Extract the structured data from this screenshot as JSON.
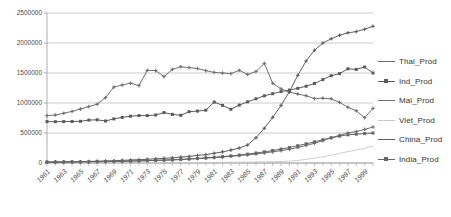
{
  "chart_data": {
    "type": "line",
    "title": "",
    "xlabel": "",
    "ylabel": "",
    "ylim": [
      0,
      2500000
    ],
    "ytick_labels": [
      "0",
      "500000",
      "1000000",
      "1500000",
      "2000000",
      "2500000"
    ],
    "yticks": [
      0,
      500000,
      1000000,
      1500000,
      2000000,
      2500000
    ],
    "grid": true,
    "legend_position": "right",
    "x": [
      1961,
      1962,
      1963,
      1964,
      1965,
      1966,
      1967,
      1968,
      1969,
      1970,
      1971,
      1972,
      1973,
      1974,
      1975,
      1976,
      1977,
      1978,
      1979,
      1980,
      1981,
      1982,
      1983,
      1984,
      1985,
      1986,
      1987,
      1988,
      1989,
      1990,
      1991,
      1992,
      1993,
      1994,
      1995,
      1996,
      1997,
      1998,
      1999,
      2000
    ],
    "tick_labels": [
      "1961",
      "1963",
      "1965",
      "1967",
      "1969",
      "1971",
      "1973",
      "1975",
      "1977",
      "1979",
      "1981",
      "1983",
      "1985",
      "1987",
      "1989",
      "1991",
      "1993",
      "1995",
      "1997",
      "1999"
    ],
    "series": [
      {
        "name": "Thai_Prod",
        "color": "#6e6e6e",
        "marker": "cross",
        "values": [
          17000,
          18000,
          19000,
          20000,
          21000,
          22000,
          24000,
          26000,
          28000,
          30000,
          33000,
          36000,
          40000,
          44000,
          48000,
          52000,
          58000,
          66000,
          74000,
          82000,
          90000,
          100000,
          112000,
          124000,
          136000,
          150000,
          168000,
          186000,
          206000,
          230000,
          258000,
          292000,
          330000,
          372000,
          420000,
          462000,
          500000,
          525000,
          560000,
          600000
        ]
      },
      {
        "name": "Ind_Prod",
        "color": "#5a5a5a",
        "marker": "square",
        "values": [
          690000,
          688000,
          690000,
          692000,
          695000,
          715000,
          720000,
          700000,
          735000,
          760000,
          780000,
          790000,
          790000,
          800000,
          840000,
          810000,
          795000,
          855000,
          865000,
          880000,
          1015000,
          960000,
          895000,
          965000,
          1020000,
          1070000,
          1120000,
          1155000,
          1190000,
          1215000,
          1245000,
          1280000,
          1325000,
          1390000,
          1455000,
          1490000,
          1570000,
          1560000,
          1600000,
          1500000
        ]
      },
      {
        "name": "Mal_Prod",
        "color": "#707070",
        "marker": "cross",
        "values": [
          790000,
          800000,
          830000,
          860000,
          900000,
          940000,
          980000,
          1090000,
          1265000,
          1300000,
          1330000,
          1290000,
          1545000,
          1540000,
          1440000,
          1560000,
          1605000,
          1590000,
          1575000,
          1540000,
          1510000,
          1500000,
          1490000,
          1545000,
          1475000,
          1525000,
          1660000,
          1330000,
          1235000,
          1180000,
          1150000,
          1120000,
          1075000,
          1080000,
          1070000,
          1010000,
          930000,
          870000,
          755000,
          910000
        ]
      },
      {
        "name": "Viet_Prod",
        "color": "#c8c8c8",
        "marker": "none",
        "values": [
          4000,
          4000,
          4500,
          4500,
          5000,
          5000,
          5500,
          5500,
          6000,
          6000,
          6500,
          6500,
          7000,
          7000,
          7500,
          8000,
          8500,
          9000,
          9500,
          10000,
          11000,
          12000,
          13000,
          14000,
          15000,
          17000,
          19000,
          22000,
          26000,
          32000,
          42000,
          60000,
          82000,
          105000,
          130000,
          160000,
          190000,
          215000,
          245000,
          282000
        ]
      },
      {
        "name": "China_Prod",
        "color": "#5f5f5f",
        "marker": "cross",
        "values": [
          12000,
          13000,
          15000,
          18000,
          22000,
          26000,
          30000,
          34000,
          38000,
          44000,
          50000,
          56000,
          62000,
          70000,
          78000,
          86000,
          98000,
          110000,
          126000,
          140000,
          162000,
          185000,
          215000,
          250000,
          300000,
          420000,
          580000,
          760000,
          960000,
          1190000,
          1460000,
          1700000,
          1880000,
          2000000,
          2070000,
          2130000,
          2170000,
          2190000,
          2230000,
          2280000
        ]
      },
      {
        "name": "India_Prod",
        "color": "#666666",
        "marker": "square",
        "values": [
          15000,
          16000,
          17000,
          18000,
          19000,
          20000,
          22000,
          24000,
          26000,
          29000,
          32000,
          35000,
          39000,
          43000,
          48000,
          53000,
          60000,
          68000,
          76000,
          85000,
          95000,
          106000,
          118000,
          132000,
          148000,
          166000,
          186000,
          208000,
          232000,
          258000,
          288000,
          320000,
          352000,
          388000,
          420000,
          448000,
          470000,
          480000,
          490000,
          500000
        ]
      }
    ]
  },
  "legend": {
    "items": [
      {
        "label": "Thai_Prod"
      },
      {
        "label": "Ind_Prod"
      },
      {
        "label": "Mal_Prod"
      },
      {
        "label": "Viet_Prod"
      },
      {
        "label": "China_Prod"
      },
      {
        "label": "India_Prod"
      }
    ]
  }
}
